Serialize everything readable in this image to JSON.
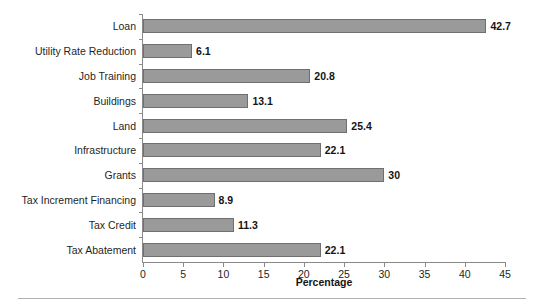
{
  "chart_data": {
    "type": "bar",
    "orientation": "horizontal",
    "title": "",
    "xlabel": "Percentage",
    "ylabel": "",
    "xlim": [
      0,
      45
    ],
    "xticks": [
      0,
      5,
      10,
      15,
      20,
      25,
      30,
      35,
      40,
      45
    ],
    "grid": false,
    "legend": false,
    "categories": [
      "Loan",
      "Utility Rate Reduction",
      "Job Training",
      "Buildings",
      "Land",
      "Infrastructure",
      "Grants",
      "Tax Increment Financing",
      "Tax Credit",
      "Tax Abatement"
    ],
    "values": [
      42.7,
      6.1,
      20.8,
      13.1,
      25.4,
      22.1,
      30,
      8.9,
      11.3,
      22.1
    ],
    "value_labels": [
      "42.7",
      "6.1",
      "20.8",
      "13.1",
      "25.4",
      "22.1",
      "30",
      "8.9",
      "11.3",
      "22.1"
    ],
    "bar_color": "#9a9a9a",
    "bar_edge_color": "#6f6f6f",
    "axis_color": "#8a8a8a",
    "text_color": "#1f1f1f"
  }
}
